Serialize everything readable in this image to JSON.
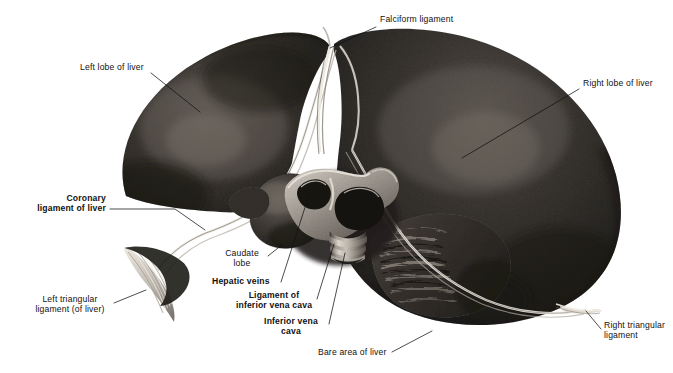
{
  "figure": {
    "background_color": "#ffffff",
    "ink_color": "#111111",
    "palette": {
      "liver_dark": "#2a2724",
      "liver_mid": "#3b3733",
      "liver_light": "#6b6560",
      "highlight": "#d8d2c9",
      "vessel_light": "#cfc9c0",
      "vessel_mid": "#8d8881",
      "vessel_dark": "#1b1917",
      "ligament_white": "#efeae2"
    }
  },
  "labels": [
    {
      "id": "falciform-ligament",
      "text": "Falciform ligament",
      "bold": false,
      "align": "left",
      "x": 380,
      "y": 20,
      "leader": [
        [
          376,
          27
        ],
        [
          330,
          48
        ]
      ]
    },
    {
      "id": "left-lobe-of-liver",
      "text": "Left lobe of liver",
      "bold": false,
      "align": "left",
      "x": 80,
      "y": 67,
      "leader": [
        [
          151,
          73
        ],
        [
          200,
          112
        ]
      ]
    },
    {
      "id": "right-lobe-of-liver",
      "text": "Right lobe of liver",
      "bold": false,
      "align": "left",
      "x": 583,
      "y": 83,
      "leader": [
        [
          579,
          89
        ],
        [
          462,
          158
        ]
      ]
    },
    {
      "id": "coronary-ligament-of-liver",
      "text": "Coronary\nligament of liver",
      "bold": true,
      "align": "right",
      "x": 20,
      "y": 203,
      "leader": [
        [
          110,
          209
        ],
        [
          175,
          209
        ],
        [
          205,
          230
        ]
      ]
    },
    {
      "id": "left-triangular-ligament",
      "text": "Left triangular\nligament (of liver)",
      "bold": false,
      "align": "left",
      "x": 57,
      "y": 303,
      "leader": [
        [
          114,
          303
        ],
        [
          146,
          290
        ]
      ]
    },
    {
      "id": "caudate-lobe",
      "text": "Caudate\nlobe",
      "bold": false,
      "align": "left",
      "x": 222,
      "y": 253,
      "leader": [
        [
          268,
          256
        ],
        [
          283,
          244
        ]
      ]
    },
    {
      "id": "hepatic-veins",
      "text": "Hepatic veins",
      "bold": true,
      "align": "left",
      "x": 212,
      "y": 281,
      "leader": [
        [
          281,
          282
        ],
        [
          309,
          195
        ]
      ]
    },
    {
      "id": "ligament-of-inferior-vena-cava",
      "text": "Ligament of\ninferior vena cava",
      "bold": true,
      "align": "left",
      "x": 245,
      "y": 296,
      "leader": [
        [
          317,
          299
        ],
        [
          334,
          244
        ]
      ]
    },
    {
      "id": "inferior-vena-cava",
      "text": "Inferior vena\ncava",
      "bold": true,
      "align": "left",
      "x": 263,
      "y": 322,
      "leader": [
        [
          329,
          324
        ],
        [
          345,
          253
        ]
      ]
    },
    {
      "id": "bare-area-of-liver",
      "text": "Bare area of liver",
      "bold": false,
      "align": "left",
      "x": 318,
      "y": 352,
      "leader": [
        [
          392,
          352
        ],
        [
          432,
          331
        ]
      ]
    },
    {
      "id": "right-triangular-ligament",
      "text": "Right triangular\nligament",
      "bold": false,
      "align": "left",
      "x": 604,
      "y": 325,
      "leader": [
        [
          601,
          329
        ],
        [
          586,
          311
        ]
      ]
    }
  ]
}
